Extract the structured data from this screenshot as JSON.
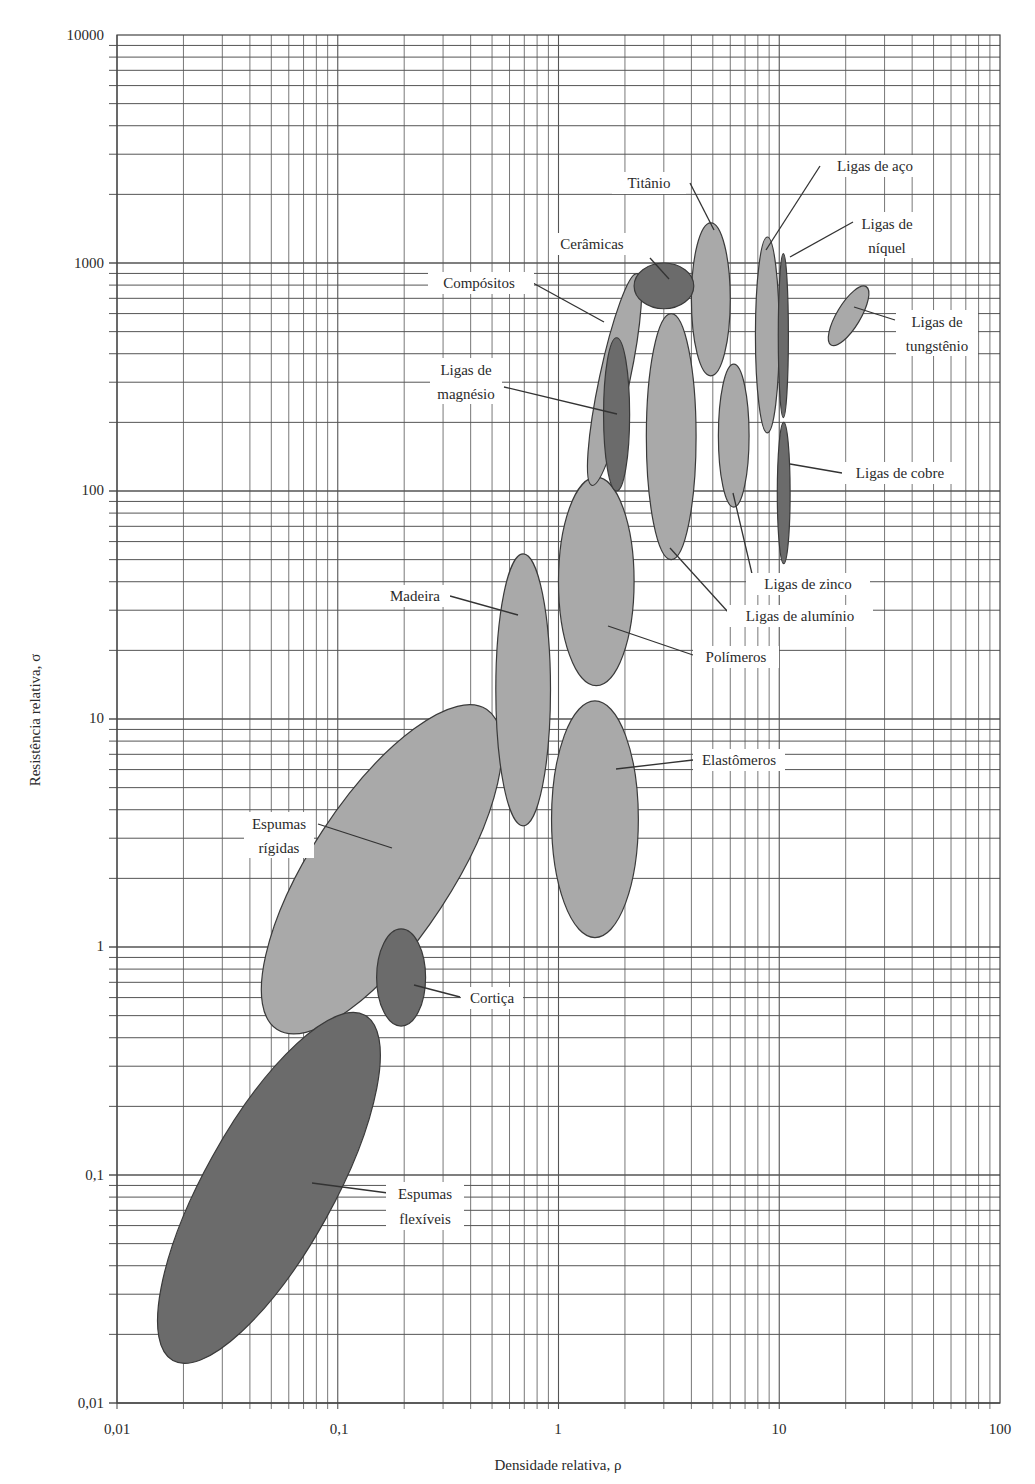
{
  "chart_data": {
    "type": "scatter",
    "subtype": "material-property-bubble-chart (log-log)",
    "title": "",
    "xlabel": "Densidade relativa, ρ",
    "ylabel": "Resistência relativa, σ",
    "xscale": "log",
    "yscale": "log",
    "xlim": [
      0.01,
      100
    ],
    "ylim": [
      0.01,
      10000
    ],
    "x_tick_labels": [
      "0,01",
      "0,1",
      "1",
      "10",
      "100"
    ],
    "x_ticks": [
      0.01,
      0.1,
      1,
      10,
      100
    ],
    "y_tick_labels": [
      "0,01",
      "0,1",
      "1",
      "10",
      "100",
      "1000",
      "10000"
    ],
    "y_ticks": [
      0.01,
      0.1,
      1,
      10,
      100,
      1000,
      10000
    ],
    "grid": true,
    "legend": "none (direct labels with leader lines)",
    "colors": {
      "light_fill": "#a9a9a9",
      "dark_fill": "#6b6b6b",
      "outline": "#3a3a3a",
      "grid": "#555555"
    },
    "series": [
      {
        "name": "Espumas flexíveis",
        "shade": "dark",
        "rho_range": [
          0.017,
          0.14
        ],
        "sigma_range": [
          0.014,
          0.55
        ],
        "rotation_deg": -58
      },
      {
        "name": "Espumas rígidas",
        "shade": "light",
        "rho_range": [
          0.05,
          0.5
        ],
        "sigma_range": [
          0.4,
          12
        ],
        "rotation_deg": -55
      },
      {
        "name": "Cortiça",
        "shade": "dark",
        "rho_range": [
          0.15,
          0.25
        ],
        "sigma_range": [
          0.45,
          1.2
        ],
        "rotation_deg": 0
      },
      {
        "name": "Madeira",
        "shade": "light",
        "rho_range": [
          0.52,
          0.92
        ],
        "sigma_range": [
          3.4,
          53
        ],
        "rotation_deg": 0
      },
      {
        "name": "Elastômeros",
        "shade": "light",
        "rho_range": [
          0.93,
          2.3
        ],
        "sigma_range": [
          1.1,
          12
        ],
        "rotation_deg": 0
      },
      {
        "name": "Polímeros",
        "shade": "light",
        "rho_range": [
          1.0,
          2.2
        ],
        "sigma_range": [
          14,
          115
        ],
        "rotation_deg": 0
      },
      {
        "name": "Compósitos",
        "shade": "light",
        "rho_range": [
          1.4,
          2.3
        ],
        "sigma_range": [
          100,
          950
        ],
        "rotation_deg": -8
      },
      {
        "name": "Ligas de magnésio",
        "shade": "dark",
        "rho_range": [
          1.6,
          2.1
        ],
        "sigma_range": [
          100,
          470
        ],
        "rotation_deg": 0
      },
      {
        "name": "Ligas de alumínio",
        "shade": "light",
        "rho_range": [
          2.5,
          4.2
        ],
        "sigma_range": [
          50,
          600
        ],
        "rotation_deg": 0
      },
      {
        "name": "Cerâmicas",
        "shade": "dark",
        "rho_range": [
          2.2,
          4.1
        ],
        "sigma_range": [
          630,
          1000
        ],
        "rotation_deg": 0
      },
      {
        "name": "Titânio",
        "shade": "light",
        "rho_range": [
          4.0,
          6.0
        ],
        "sigma_range": [
          320,
          1500
        ],
        "rotation_deg": 0
      },
      {
        "name": "Ligas de zinco",
        "shade": "light",
        "rho_range": [
          5.3,
          7.3
        ],
        "sigma_range": [
          85,
          360
        ],
        "rotation_deg": 0
      },
      {
        "name": "Ligas de aço",
        "shade": "light",
        "rho_range": [
          7.8,
          10
        ],
        "sigma_range": [
          180,
          1300
        ],
        "rotation_deg": 0
      },
      {
        "name": "Ligas de níquel",
        "shade": "dark",
        "rho_range": [
          9.9,
          11
        ],
        "sigma_range": [
          210,
          1100
        ],
        "rotation_deg": 0
      },
      {
        "name": "Ligas de cobre",
        "shade": "dark",
        "rho_range": [
          9.8,
          11.2
        ],
        "sigma_range": [
          48,
          200
        ],
        "rotation_deg": 0
      },
      {
        "name": "Ligas de tungstênio",
        "shade": "light",
        "rho_range": [
          17,
          25
        ],
        "sigma_range": [
          430,
          800
        ],
        "rotation_deg": -20
      }
    ]
  },
  "labels": {
    "espumas_flexiveis": [
      "Espumas",
      "flexíveis"
    ],
    "espumas_rigidas": [
      "Espumas",
      "rígidas"
    ],
    "cortica": "Cortiça",
    "madeira": "Madeira",
    "elastomeros": "Elastômeros",
    "polimeros": "Polímeros",
    "compositos": "Compósitos",
    "magnesio": [
      "Ligas de",
      "magnésio"
    ],
    "aluminio": "Ligas de alumínio",
    "ceramicas": "Cerâmicas",
    "titanio": "Titânio",
    "zinco": "Ligas de zinco",
    "aco": "Ligas de aço",
    "niquel": [
      "Ligas de",
      "níquel"
    ],
    "cobre": "Ligas de cobre",
    "tungstenio": [
      "Ligas de",
      "tungstênio"
    ]
  }
}
